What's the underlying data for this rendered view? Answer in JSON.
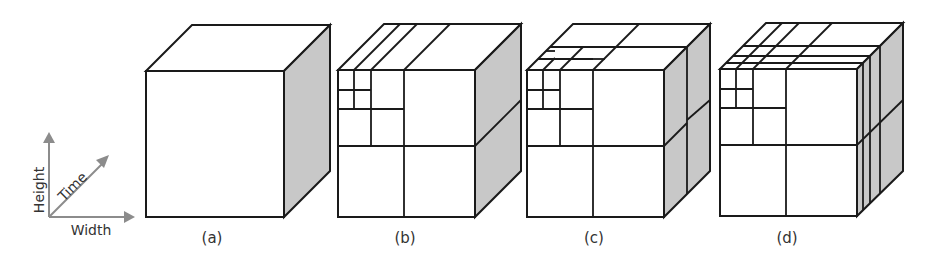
{
  "figure": {
    "axes": {
      "height_label": "Height",
      "time_label": "Time",
      "width_label": "Width"
    },
    "panels": [
      {
        "caption": "(a)",
        "description": "undivided spatio-temporal volume"
      },
      {
        "caption": "(b)",
        "description": "spatial quadtree subdivision of front face, extended through time"
      },
      {
        "caption": "(c)",
        "description": "spatial quadtree subdivision with temporal split"
      },
      {
        "caption": "(d)",
        "description": "spatial quadtree subdivision with multiple temporal splits"
      }
    ],
    "colors": {
      "edge": "#1a1a1a",
      "side_face": "#c8c8c8",
      "axis": "#8c8c8c",
      "text": "#333333"
    }
  }
}
